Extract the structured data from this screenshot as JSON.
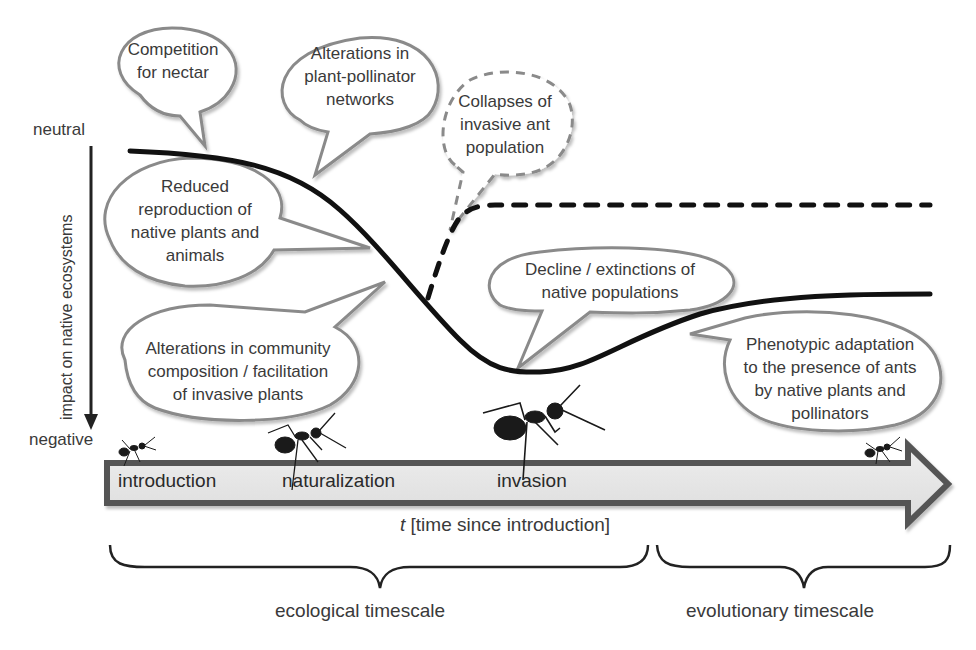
{
  "colors": {
    "curve": "#111111",
    "bubble_stroke": "#8a8a8a",
    "arrow_fill": "#e4e4e4",
    "arrow_stroke": "#555555",
    "text": "#3a3a3a"
  },
  "y_axis": {
    "top_label": "neutral",
    "bottom_label": "negative",
    "title": "impact on native ecosystems",
    "direction": "down"
  },
  "x_axis": {
    "title_italic": "t",
    "title_rest": " [time since introduction]",
    "stages": [
      "introduction",
      "naturalization",
      "invasion"
    ]
  },
  "bubbles": [
    {
      "id": "competition",
      "text": [
        "Competition",
        "for nectar"
      ],
      "style": "solid"
    },
    {
      "id": "plant-pollinator",
      "text": [
        "Alterations in",
        "plant-pollinator",
        "networks"
      ],
      "style": "solid"
    },
    {
      "id": "collapse",
      "text": [
        "Collapses of",
        "invasive ant",
        "population"
      ],
      "style": "dashed"
    },
    {
      "id": "reduced-reproduction",
      "text": [
        "Reduced",
        "reproduction of",
        "native plants and",
        "animals"
      ],
      "style": "solid"
    },
    {
      "id": "decline",
      "text": [
        "Decline / extinctions of",
        "native populations"
      ],
      "style": "solid"
    },
    {
      "id": "community",
      "text": [
        "Alterations in community",
        "composition / facilitation",
        "of invasive plants"
      ],
      "style": "solid"
    },
    {
      "id": "adaptation",
      "text": [
        "Phenotypic adaptation",
        "to the presence of ants",
        "by native plants and",
        "pollinators"
      ],
      "style": "solid"
    }
  ],
  "timescales": [
    {
      "label": "ecological timescale"
    },
    {
      "label": "evolutionary timescale"
    }
  ],
  "curves": {
    "main": "solid impact curve: neutral → steep decline → minimum at invasion → partial recovery",
    "collapse": "dashed branch: recovery toward near-neutral after ant population collapse"
  }
}
